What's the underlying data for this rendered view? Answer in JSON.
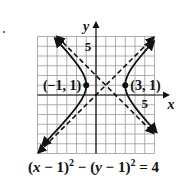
{
  "chart_data": {
    "type": "line",
    "title": "",
    "equation": {
      "part1_open": "(",
      "x_var": "x",
      "part1_rest": " − 1)",
      "exp1": "2",
      "minus": " − (",
      "y_var": "y",
      "part2_rest": " − 1)",
      "exp2": "2",
      "equals": " = 4"
    },
    "xlabel": "x",
    "ylabel": "y",
    "xlim": [
      -6,
      6
    ],
    "ylim": [
      -6,
      6
    ],
    "grid": true,
    "grid_step": 1,
    "x_tick_labels": [
      {
        "value": 5,
        "label": "5"
      }
    ],
    "y_tick_labels": [
      {
        "value": 5,
        "label": "5"
      }
    ],
    "hyperbola": {
      "center": [
        1,
        1
      ],
      "a": 2,
      "b": 2,
      "orientation": "horizontal",
      "branches": [
        {
          "name": "left-branch",
          "y_range": [
            -5.2,
            5.8
          ]
        },
        {
          "name": "right-branch",
          "y_range": [
            -3.8,
            5.5
          ]
        }
      ]
    },
    "asymptotes": [
      {
        "name": "asymptote-rising",
        "slope": 1,
        "intercept": 0,
        "x_range": [
          -5.9,
          5.9
        ]
      },
      {
        "name": "asymptote-falling",
        "slope": -1,
        "intercept": 2,
        "x_range": [
          -4.0,
          5.9
        ]
      }
    ],
    "points": [
      {
        "x": -1,
        "y": 1,
        "label": "(−1, 1)",
        "label_side": "left"
      },
      {
        "x": 3,
        "y": 1,
        "label": "(3, 1)",
        "label_side": "right"
      }
    ]
  }
}
